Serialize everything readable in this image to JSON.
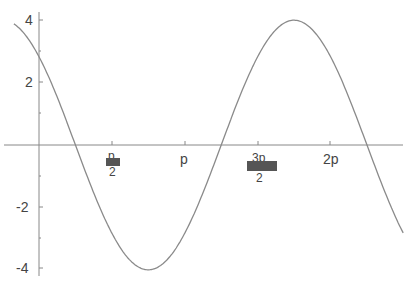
{
  "chart_data": {
    "type": "line",
    "title": "",
    "xlabel": "",
    "ylabel": "",
    "function": "4*cos(x + pi/4)",
    "xlim": [
      -0.54,
      7.85
    ],
    "ylim": [
      -4.3,
      4.6
    ],
    "grid": false,
    "legend": null,
    "x_ticks": [
      {
        "value": 1.5708,
        "label": "p/2 (π/2, rendered garbled)"
      },
      {
        "value": 3.1416,
        "label": "p"
      },
      {
        "value": 4.7124,
        "label": "3p/2 (3π/2, rendered garbled)"
      },
      {
        "value": 6.2832,
        "label": "2p"
      }
    ],
    "y_ticks": [
      {
        "value": 4,
        "label": "4"
      },
      {
        "value": 2,
        "label": "2"
      },
      {
        "value": -2,
        "label": "-2"
      },
      {
        "value": -4,
        "label": "-4"
      }
    ],
    "series": [
      {
        "name": "f(x)",
        "x": [
          -0.54,
          0,
          0.785,
          1.571,
          2.356,
          3.142,
          3.927,
          4.712,
          5.498,
          6.283,
          7.069,
          7.85
        ],
        "values": [
          3.78,
          2.83,
          0,
          -2.83,
          -4,
          -2.83,
          0,
          2.83,
          4,
          2.83,
          0,
          -2.82
        ]
      }
    ]
  },
  "labels": {
    "y4": "4",
    "y2": "2",
    "ym2": "-2",
    "ym4": "-4",
    "x_pi_half_top": "p",
    "x_pi_half_bottom": "2",
    "x_pi": "p",
    "x_3pi_half_top": "3p",
    "x_3pi_half_bottom": "2",
    "x_2pi": "2p"
  }
}
